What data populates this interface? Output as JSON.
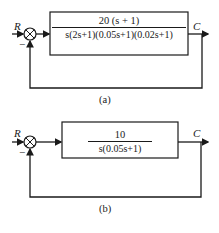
{
  "diagram_a": {
    "input_label": "R",
    "feedback_sign": "−",
    "output_label": "C",
    "transfer_function": {
      "numerator": "20 (s + 1)",
      "denominator": "s(2s+1)(0.05s+1)(0.02s+1)"
    },
    "caption": "(a)"
  },
  "diagram_b": {
    "input_label": "R",
    "feedback_sign": "−",
    "output_label": "C",
    "transfer_function": {
      "numerator": "10",
      "denominator": "s(0.05s+1)"
    },
    "caption": "(b)"
  }
}
